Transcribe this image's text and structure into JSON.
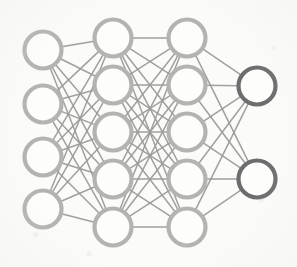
{
  "figure": {
    "kind": "neural-network-diagram",
    "title": "",
    "width": 297,
    "height": 267,
    "background_color": "#fbfbfa"
  },
  "style": {
    "node_fill": "#fdfdfc",
    "node_stroke_light": "#b3b3b1",
    "node_stroke_dark": "#6d6d6d",
    "node_stroke_width": 4.2,
    "node_radius": 18.5,
    "edge_color": "#9b9b99",
    "edge_width": 1.5,
    "edge_opacity": 0.95
  },
  "layers": [
    {
      "id": "input",
      "name": "input-layer",
      "label": "",
      "node_count": 4,
      "x": 43,
      "node_kind": "light",
      "nodes": [
        {
          "id": "i1",
          "label": "",
          "x": 43,
          "y": 50
        },
        {
          "id": "i2",
          "label": "",
          "x": 43,
          "y": 104
        },
        {
          "id": "i3",
          "label": "",
          "x": 43,
          "y": 157
        },
        {
          "id": "i4",
          "label": "",
          "x": 43,
          "y": 209
        }
      ]
    },
    {
      "id": "hidden1",
      "name": "hidden-layer-1",
      "label": "",
      "node_count": 5,
      "x": 113,
      "node_kind": "light",
      "nodes": [
        {
          "id": "h1_1",
          "label": "",
          "x": 113,
          "y": 38
        },
        {
          "id": "h1_2",
          "label": "",
          "x": 113,
          "y": 85
        },
        {
          "id": "h1_3",
          "label": "",
          "x": 113,
          "y": 132
        },
        {
          "id": "h1_4",
          "label": "",
          "x": 113,
          "y": 179
        },
        {
          "id": "h1_5",
          "label": "",
          "x": 113,
          "y": 227
        }
      ]
    },
    {
      "id": "hidden2",
      "name": "hidden-layer-2",
      "label": "",
      "node_count": 5,
      "x": 187,
      "node_kind": "light",
      "nodes": [
        {
          "id": "h2_1",
          "label": "",
          "x": 187,
          "y": 38
        },
        {
          "id": "h2_2",
          "label": "",
          "x": 187,
          "y": 85
        },
        {
          "id": "h2_3",
          "label": "",
          "x": 187,
          "y": 132
        },
        {
          "id": "h2_4",
          "label": "",
          "x": 187,
          "y": 179
        },
        {
          "id": "h2_5",
          "label": "",
          "x": 187,
          "y": 227
        }
      ]
    },
    {
      "id": "output",
      "name": "output-layer",
      "label": "",
      "node_count": 2,
      "x": 257,
      "node_kind": "dark",
      "nodes": [
        {
          "id": "o1",
          "label": "",
          "x": 257,
          "y": 86
        },
        {
          "id": "o2",
          "label": "",
          "x": 257,
          "y": 179
        }
      ]
    }
  ],
  "connections": [
    {
      "from_layer": "input",
      "to_layer": "hidden1",
      "fully_connected": true
    },
    {
      "from_layer": "hidden1",
      "to_layer": "hidden2",
      "fully_connected": true
    },
    {
      "from_layer": "hidden2",
      "to_layer": "output",
      "fully_connected": true
    }
  ]
}
